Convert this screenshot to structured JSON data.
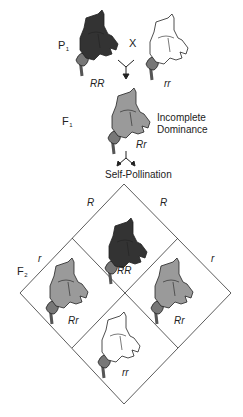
{
  "diagram": {
    "generations": {
      "p1": {
        "label": "P",
        "subscript": "1"
      },
      "f1": {
        "label": "F",
        "subscript": "1"
      },
      "f2": {
        "label": "F",
        "subscript": "2"
      }
    },
    "cross_symbol": "X",
    "parents": [
      {
        "genotype": "RR",
        "color": "dark red (black)",
        "fill": "#333333"
      },
      {
        "genotype": "rr",
        "color": "white",
        "fill": "#ffffff"
      }
    ],
    "f1_offspring": {
      "genotype": "Rr",
      "fill": "#9a9a9a"
    },
    "annotation": {
      "line1": "Incomplete",
      "line2": "Dominance"
    },
    "process": "Self-Pollination",
    "punnett": {
      "gametes_left": {
        "upper": "R",
        "lower": "r"
      },
      "gametes_right": {
        "upper": "R",
        "lower": "r"
      },
      "cells": [
        {
          "position": "top",
          "genotype": "RR",
          "fill": "#333333"
        },
        {
          "position": "left",
          "genotype": "Rr",
          "fill": "#9a9a9a"
        },
        {
          "position": "right",
          "genotype": "Rr",
          "fill": "#9a9a9a"
        },
        {
          "position": "bottom",
          "genotype": "rr",
          "fill": "#ffffff"
        }
      ]
    }
  }
}
